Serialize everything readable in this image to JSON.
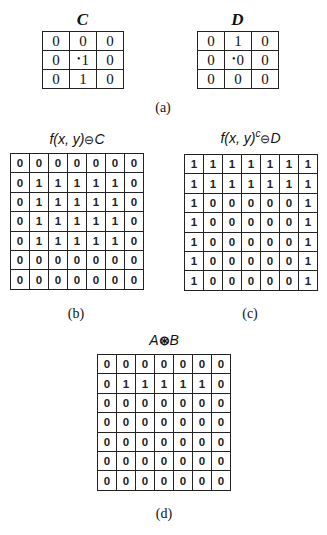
{
  "panels": {
    "a": {
      "caption": "(a)",
      "C": {
        "title": "C",
        "rows": [
          [
            "0",
            "0",
            "0"
          ],
          [
            "0",
            "1",
            "0"
          ],
          [
            "0",
            "1",
            "0"
          ]
        ],
        "origin": [
          1,
          1
        ]
      },
      "D": {
        "title": "D",
        "rows": [
          [
            "0",
            "1",
            "0"
          ],
          [
            "0",
            "0",
            "0"
          ],
          [
            "0",
            "0",
            "0"
          ]
        ],
        "origin": [
          1,
          1
        ]
      },
      "origin_marker": "•"
    },
    "b": {
      "caption": "(b)",
      "title": "f(x, y)⊖C",
      "title_parts": {
        "pre": "f(x, y)",
        "op": "⊖",
        "post": "C"
      },
      "rows": [
        [
          "0",
          "0",
          "0",
          "0",
          "0",
          "0",
          "0"
        ],
        [
          "0",
          "1",
          "1",
          "1",
          "1",
          "1",
          "0"
        ],
        [
          "0",
          "1",
          "1",
          "1",
          "1",
          "1",
          "0"
        ],
        [
          "0",
          "1",
          "1",
          "1",
          "1",
          "1",
          "0"
        ],
        [
          "0",
          "1",
          "1",
          "1",
          "1",
          "1",
          "0"
        ],
        [
          "0",
          "0",
          "0",
          "0",
          "0",
          "0",
          "0"
        ],
        [
          "0",
          "0",
          "0",
          "0",
          "0",
          "0",
          "0"
        ]
      ]
    },
    "c": {
      "caption": "(c)",
      "title": "f(x, y)^c⊖D",
      "title_parts": {
        "pre": "f(x, y)",
        "sup": "c",
        "op": "⊖",
        "post": "D"
      },
      "rows": [
        [
          "1",
          "1",
          "1",
          "1",
          "1",
          "1",
          "1"
        ],
        [
          "1",
          "1",
          "1",
          "1",
          "1",
          "1",
          "1"
        ],
        [
          "1",
          "0",
          "0",
          "0",
          "0",
          "0",
          "1"
        ],
        [
          "1",
          "0",
          "0",
          "0",
          "0",
          "0",
          "1"
        ],
        [
          "1",
          "0",
          "0",
          "0",
          "0",
          "0",
          "1"
        ],
        [
          "1",
          "0",
          "0",
          "0",
          "0",
          "0",
          "1"
        ],
        [
          "1",
          "0",
          "0",
          "0",
          "0",
          "0",
          "1"
        ]
      ]
    },
    "d": {
      "caption": "(d)",
      "title": "A⊛B",
      "title_parts": {
        "pre": "A",
        "op": "⊛",
        "post": "B"
      },
      "rows": [
        [
          "0",
          "0",
          "0",
          "0",
          "0",
          "0",
          "0"
        ],
        [
          "0",
          "1",
          "1",
          "1",
          "1",
          "1",
          "0"
        ],
        [
          "0",
          "0",
          "0",
          "0",
          "0",
          "0",
          "0"
        ],
        [
          "0",
          "0",
          "0",
          "0",
          "0",
          "0",
          "0"
        ],
        [
          "0",
          "0",
          "0",
          "0",
          "0",
          "0",
          "0"
        ],
        [
          "0",
          "0",
          "0",
          "0",
          "0",
          "0",
          "0"
        ],
        [
          "0",
          "0",
          "0",
          "0",
          "0",
          "0",
          "0"
        ]
      ]
    }
  }
}
